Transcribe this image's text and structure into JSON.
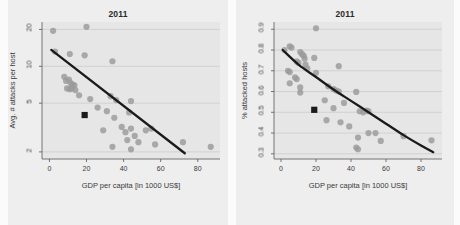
{
  "figure": {
    "width": 460,
    "height": 225,
    "background": "#fbfbfb",
    "panel_background": "#eeeeee",
    "plot_background": "#e6e6e6",
    "point_color": "#9a9a9a",
    "trend_color": "#1a1a1a",
    "grid_color": "#c9c9c9",
    "axis_color": "#555555",
    "highlight_color": "#1a1a1a"
  },
  "panels": [
    {
      "id": "left",
      "title": "2011",
      "ylabel": "Avg. # attacks per host",
      "xlabel": "GDP per capita [in 1000 US$]",
      "yticks": [
        "2",
        "5",
        "10",
        "20"
      ],
      "xticks": [
        "0",
        "20",
        "40",
        "60",
        "80"
      ],
      "highlight_label": "highlighted-country-marker"
    },
    {
      "id": "right",
      "title": "2011",
      "ylabel": "% attacked hosts",
      "xlabel": "GDP per capita [in 1000 US$]",
      "yticks": [
        "0.3",
        "0.4",
        "0.5",
        "0.6",
        "0.7",
        "0.8",
        "0.9"
      ],
      "xticks": [
        "0",
        "20",
        "40",
        "60",
        "80"
      ],
      "highlight_label": "highlighted-country-marker"
    }
  ],
  "chart_data": [
    {
      "type": "scatter",
      "id": "avg-attacks-per-host",
      "title": "2011",
      "xlabel": "GDP per capita [in 1000 US$]",
      "ylabel": "Avg. # attacks per host",
      "xlim": [
        -4,
        92
      ],
      "ylim_log": [
        1.75,
        23
      ],
      "yscale": "log",
      "xticks": [
        0,
        20,
        40,
        60,
        80
      ],
      "yticks": [
        2,
        5,
        10,
        20
      ],
      "grid": "horizontal",
      "legend": "none",
      "points": [
        {
          "x": 2.0,
          "y": 19.5
        },
        {
          "x": 20.0,
          "y": 21.0
        },
        {
          "x": 3.0,
          "y": 13.2
        },
        {
          "x": 11.0,
          "y": 12.6
        },
        {
          "x": 19.0,
          "y": 12.3
        },
        {
          "x": 34.0,
          "y": 11.0
        },
        {
          "x": 8.0,
          "y": 8.2
        },
        {
          "x": 9.0,
          "y": 7.6
        },
        {
          "x": 10.5,
          "y": 7.8
        },
        {
          "x": 11.5,
          "y": 7.3
        },
        {
          "x": 12.5,
          "y": 7.1
        },
        {
          "x": 13.5,
          "y": 7.0
        },
        {
          "x": 9.5,
          "y": 6.6
        },
        {
          "x": 11.0,
          "y": 6.5
        },
        {
          "x": 12.0,
          "y": 6.6
        },
        {
          "x": 14.0,
          "y": 6.4
        },
        {
          "x": 16.0,
          "y": 5.8
        },
        {
          "x": 22.0,
          "y": 5.4
        },
        {
          "x": 33.0,
          "y": 5.7
        },
        {
          "x": 36.0,
          "y": 5.3
        },
        {
          "x": 44.0,
          "y": 5.2
        },
        {
          "x": 26.0,
          "y": 4.6
        },
        {
          "x": 31.0,
          "y": 4.3
        },
        {
          "x": 35.0,
          "y": 3.8
        },
        {
          "x": 43.0,
          "y": 4.2
        },
        {
          "x": 29.0,
          "y": 3.0
        },
        {
          "x": 39.0,
          "y": 3.2
        },
        {
          "x": 41.0,
          "y": 2.9
        },
        {
          "x": 44.0,
          "y": 3.1
        },
        {
          "x": 46.0,
          "y": 2.7
        },
        {
          "x": 52.0,
          "y": 3.0
        },
        {
          "x": 55.0,
          "y": 3.1
        },
        {
          "x": 34.0,
          "y": 2.2
        },
        {
          "x": 42.0,
          "y": 2.5
        },
        {
          "x": 44.0,
          "y": 2.1
        },
        {
          "x": 48.0,
          "y": 2.4
        },
        {
          "x": 57.0,
          "y": 2.3
        },
        {
          "x": 72.0,
          "y": 2.4
        },
        {
          "x": 87.0,
          "y": 2.2
        }
      ],
      "highlight_point": {
        "x": 19.0,
        "y": 4.0
      },
      "trend": {
        "type": "log-linear",
        "points": [
          [
            1.0,
            13.6
          ],
          [
            73.0,
            1.95
          ]
        ]
      }
    },
    {
      "type": "scatter",
      "id": "percent-attacked-hosts",
      "title": "2011",
      "xlabel": "GDP per capita [in 1000 US$]",
      "ylabel": "% attacked hosts",
      "xlim": [
        -4,
        92
      ],
      "ylim": [
        0.275,
        0.935
      ],
      "yscale": "linear",
      "xticks": [
        0,
        20,
        40,
        60,
        80
      ],
      "yticks": [
        0.3,
        0.4,
        0.5,
        0.6,
        0.7,
        0.8,
        0.9
      ],
      "grid": "horizontal",
      "legend": "none",
      "points": [
        {
          "x": 20.0,
          "y": 0.905
        },
        {
          "x": 5.0,
          "y": 0.818
        },
        {
          "x": 6.0,
          "y": 0.812
        },
        {
          "x": 2.0,
          "y": 0.8
        },
        {
          "x": 11.0,
          "y": 0.79
        },
        {
          "x": 12.0,
          "y": 0.78
        },
        {
          "x": 13.0,
          "y": 0.772
        },
        {
          "x": 13.5,
          "y": 0.758
        },
        {
          "x": 19.0,
          "y": 0.762
        },
        {
          "x": 9.0,
          "y": 0.745
        },
        {
          "x": 10.0,
          "y": 0.738
        },
        {
          "x": 14.0,
          "y": 0.73
        },
        {
          "x": 4.0,
          "y": 0.7
        },
        {
          "x": 5.0,
          "y": 0.694
        },
        {
          "x": 15.0,
          "y": 0.712
        },
        {
          "x": 20.0,
          "y": 0.69
        },
        {
          "x": 33.0,
          "y": 0.722
        },
        {
          "x": 8.0,
          "y": 0.668
        },
        {
          "x": 9.0,
          "y": 0.66
        },
        {
          "x": 5.0,
          "y": 0.64
        },
        {
          "x": 11.0,
          "y": 0.62
        },
        {
          "x": 27.0,
          "y": 0.625
        },
        {
          "x": 30.0,
          "y": 0.612
        },
        {
          "x": 31.5,
          "y": 0.605
        },
        {
          "x": 33.0,
          "y": 0.6
        },
        {
          "x": 11.0,
          "y": 0.595
        },
        {
          "x": 43.0,
          "y": 0.598
        },
        {
          "x": 25.0,
          "y": 0.558
        },
        {
          "x": 36.0,
          "y": 0.545
        },
        {
          "x": 30.0,
          "y": 0.52
        },
        {
          "x": 45.0,
          "y": 0.505
        },
        {
          "x": 47.0,
          "y": 0.5
        },
        {
          "x": 49.0,
          "y": 0.508
        },
        {
          "x": 50.0,
          "y": 0.505
        },
        {
          "x": 26.0,
          "y": 0.462
        },
        {
          "x": 34.0,
          "y": 0.452
        },
        {
          "x": 39.0,
          "y": 0.432
        },
        {
          "x": 50.0,
          "y": 0.4
        },
        {
          "x": 54.0,
          "y": 0.4
        },
        {
          "x": 44.0,
          "y": 0.378
        },
        {
          "x": 57.0,
          "y": 0.362
        },
        {
          "x": 70.0,
          "y": 0.385
        },
        {
          "x": 86.0,
          "y": 0.365
        },
        {
          "x": 43.0,
          "y": 0.33
        },
        {
          "x": 44.0,
          "y": 0.322
        }
      ],
      "highlight_point": {
        "x": 19.0,
        "y": 0.512
      },
      "trend": {
        "type": "exponential-decay",
        "points": [
          [
            1.0,
            0.8
          ],
          [
            10.0,
            0.73
          ],
          [
            20.0,
            0.67
          ],
          [
            30.0,
            0.61
          ],
          [
            40.0,
            0.555
          ],
          [
            50.0,
            0.5
          ],
          [
            60.0,
            0.445
          ],
          [
            70.0,
            0.39
          ],
          [
            80.0,
            0.34
          ],
          [
            87.0,
            0.308
          ]
        ]
      }
    }
  ]
}
